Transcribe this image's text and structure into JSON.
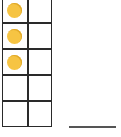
{
  "ten_frame": {
    "rows": 5,
    "columns": 2,
    "filled_count": 3,
    "dot_color": "#f6c443",
    "line_color": "#2a2a2a",
    "cells": [
      [
        "filled",
        "empty"
      ],
      [
        "filled",
        "empty"
      ],
      [
        "filled",
        "empty"
      ],
      [
        "empty",
        "empty"
      ],
      [
        "empty",
        "empty"
      ]
    ]
  },
  "answer": {
    "value": ""
  }
}
